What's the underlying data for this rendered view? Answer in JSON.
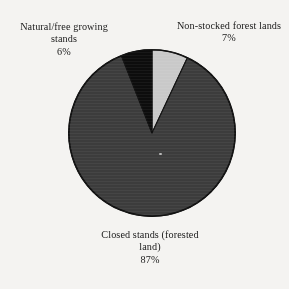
{
  "figure": {
    "background_color": "#f4f3f1",
    "text_color": "#191919"
  },
  "chart_data": {
    "type": "pie",
    "title": "",
    "subtitle": "",
    "xlabel": "",
    "ylabel": "",
    "grid": false,
    "legend_position": "none",
    "labels_placement": "outside-callout",
    "units": "percent",
    "total": 100,
    "start_angle_deg": 0,
    "direction": "clockwise",
    "center_px": [
      152,
      133
    ],
    "radius_px": 84,
    "categories": [
      "Non-stocked forest lands",
      "Closed stands (forested land)",
      "Natural/free growing stands"
    ],
    "values": [
      7,
      87,
      6
    ],
    "slices": [
      {
        "name": "Non-stocked forest lands",
        "value": 7,
        "value_label": "7%",
        "color": "#c9c9c9",
        "start_deg": 0,
        "end_deg": 25.2
      },
      {
        "name": "Closed stands (forested land)",
        "value": 87,
        "value_label": "87%",
        "color": "#3c3c3c",
        "start_deg": 25.2,
        "end_deg": 338.4
      },
      {
        "name": "Natural/free growing stands",
        "value": 6,
        "value_label": "6%",
        "color": "#0d0d0d",
        "start_deg": 338.4,
        "end_deg": 360
      }
    ],
    "outline_color": "#111111"
  },
  "labels": {
    "natural": {
      "line1": "Natural/free growing",
      "line2": "stands",
      "line3": "6%"
    },
    "nonstocked": {
      "line1": "Non-stocked forest lands",
      "line2": "7%"
    },
    "closed": {
      "line1": "Closed stands (forested",
      "line2": "land)",
      "line3": "87%"
    }
  }
}
